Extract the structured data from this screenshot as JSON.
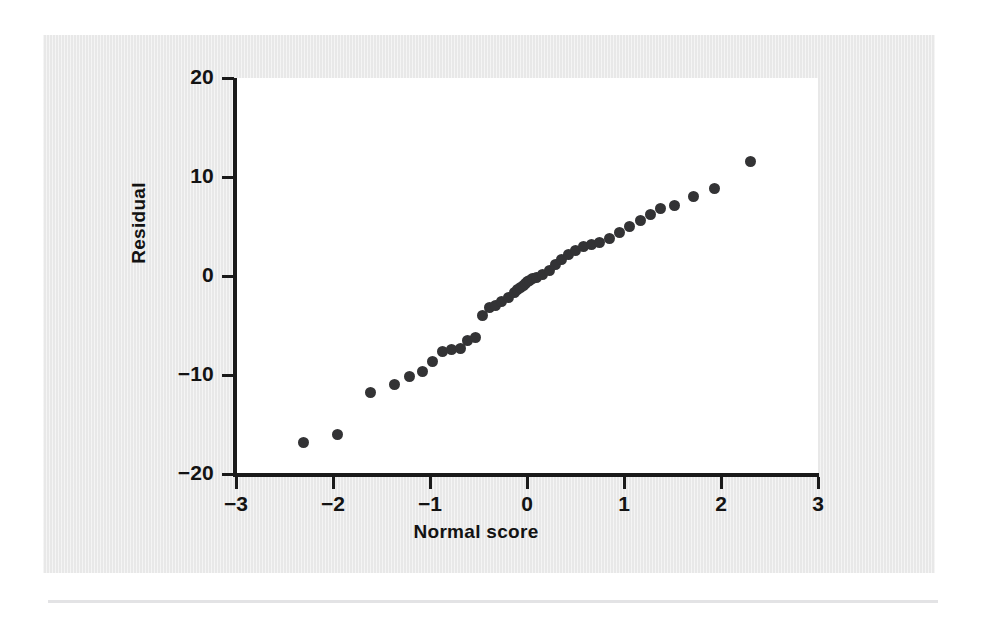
{
  "figure": {
    "background_color": "#e8e8e8",
    "plot_background_color": "#ffffff",
    "axis_color": "#1a1a1a",
    "point_color": "#333335"
  },
  "chart_data": {
    "type": "scatter",
    "title": "",
    "xlabel": "Normal score",
    "ylabel": "Residual",
    "xlim": [
      -3,
      3
    ],
    "ylim": [
      -20,
      20
    ],
    "xticks": [
      -3,
      -2,
      -1,
      0,
      1,
      2,
      3
    ],
    "xticklabels": [
      "−3",
      "−2",
      "−1",
      "0",
      "1",
      "2",
      "3"
    ],
    "yticks": [
      -20,
      -10,
      0,
      10,
      20
    ],
    "yticklabels": [
      "−20",
      "−10",
      "0",
      "10",
      "20"
    ],
    "grid": false,
    "legend": null,
    "marker": "filled-circle",
    "n_points": 45,
    "x": [
      -2.3,
      -1.95,
      -1.61,
      -1.37,
      -1.21,
      -1.08,
      -0.97,
      -0.87,
      -0.78,
      -0.69,
      -0.61,
      -0.53,
      -0.46,
      -0.39,
      -0.32,
      -0.26,
      -0.19,
      -0.13,
      -0.1,
      -0.07,
      -0.04,
      -0.02,
      0.0,
      0.03,
      0.06,
      0.1,
      0.16,
      0.23,
      0.29,
      0.36,
      0.43,
      0.5,
      0.58,
      0.66,
      0.75,
      0.85,
      0.95,
      1.06,
      1.17,
      1.27,
      1.38,
      1.52,
      1.72,
      1.93,
      2.3
    ],
    "y": [
      -16.8,
      -16.0,
      -11.8,
      -11.0,
      -10.2,
      -9.6,
      -8.6,
      -7.6,
      -7.4,
      -7.3,
      -6.5,
      -6.2,
      -4.0,
      -3.2,
      -3.0,
      -2.6,
      -2.2,
      -1.7,
      -1.4,
      -1.2,
      -1.0,
      -0.8,
      -0.6,
      -0.5,
      -0.3,
      -0.2,
      0.2,
      0.6,
      1.2,
      1.7,
      2.2,
      2.6,
      3.0,
      3.2,
      3.4,
      3.8,
      4.4,
      5.0,
      5.6,
      6.2,
      6.8,
      7.1,
      8.0,
      8.8,
      11.6
    ]
  }
}
